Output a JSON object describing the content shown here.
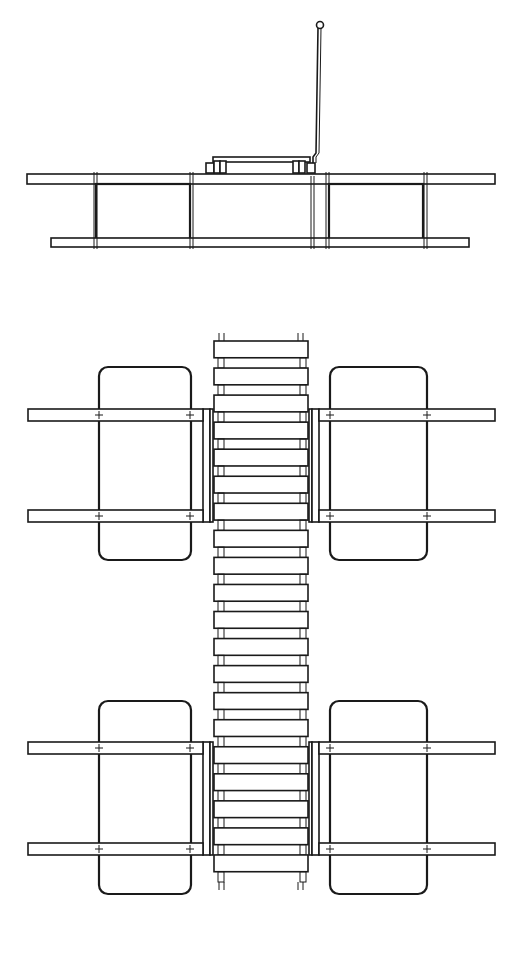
{
  "drawing": {
    "title": "Floating dock — side elevation and plan view",
    "views": [
      {
        "name": "side-elevation",
        "label": "Side elevation"
      },
      {
        "name": "plan-view",
        "label": "Plan view"
      }
    ],
    "colors": {
      "line": "#1a1a1a",
      "background": "#ffffff"
    },
    "elements": {
      "pontoons_in_elevation": 2,
      "pontoons_in_plan": 4,
      "walkway_planks": 20,
      "cross_beams_in_plan": 4,
      "mooring_pole": 1
    }
  }
}
